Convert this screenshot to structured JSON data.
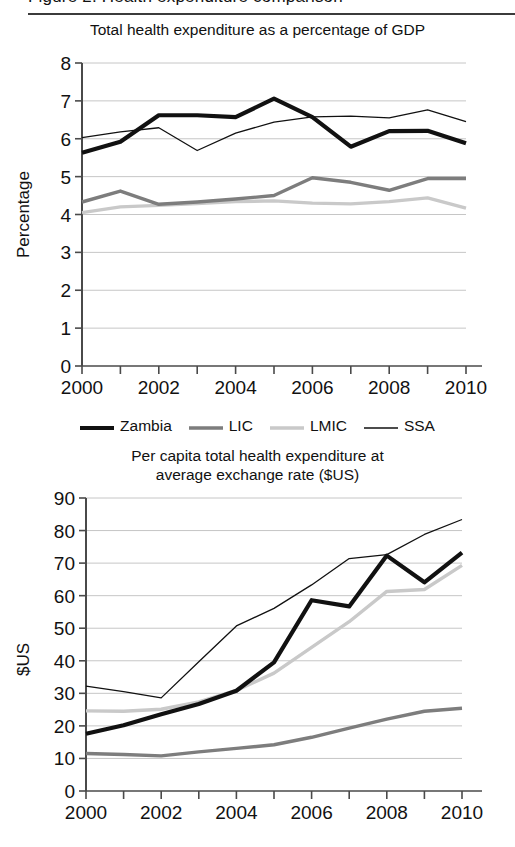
{
  "page": {
    "top_caption": "Figure 2. Health expenditure comparison",
    "background": "#ffffff"
  },
  "legend": {
    "items": [
      {
        "label": "Zambia",
        "color": "#111111",
        "width": 4.2
      },
      {
        "label": "LIC",
        "color": "#7d7d7d",
        "width": 3.4
      },
      {
        "label": "LMIC",
        "color": "#c9c9c9",
        "width": 3.4
      },
      {
        "label": "SSA",
        "color": "#111111",
        "width": 1.3
      }
    ]
  },
  "chart_data": [
    {
      "id": "gdp-share",
      "type": "line",
      "title": "Total health expenditure as a percentage of GDP",
      "xlabel": "",
      "ylabel": "Percentage",
      "x": [
        2000,
        2001,
        2002,
        2003,
        2004,
        2005,
        2006,
        2007,
        2008,
        2009,
        2010
      ],
      "xticklabels": [
        "2000",
        "",
        "2002",
        "",
        "2004",
        "",
        "2006",
        "",
        "2008",
        "",
        "2010"
      ],
      "xlim": [
        2000,
        2010
      ],
      "ylim": [
        0,
        8
      ],
      "yticks": [
        0,
        1,
        2,
        3,
        4,
        5,
        6,
        7,
        8
      ],
      "grid": true,
      "legend_position": "below",
      "series": [
        {
          "name": "Zambia",
          "color": "#111111",
          "width": 4.2,
          "values": [
            5.63,
            5.92,
            6.62,
            6.62,
            6.57,
            7.06,
            6.57,
            5.79,
            6.2,
            6.21,
            5.88
          ]
        },
        {
          "name": "LIC",
          "color": "#7d7d7d",
          "width": 3.4,
          "values": [
            4.33,
            4.62,
            4.27,
            4.33,
            4.41,
            4.5,
            4.97,
            4.85,
            4.64,
            4.95,
            4.95
          ]
        },
        {
          "name": "LMIC",
          "color": "#c9c9c9",
          "width": 3.4,
          "values": [
            4.05,
            4.2,
            4.24,
            4.29,
            4.34,
            4.36,
            4.3,
            4.28,
            4.34,
            4.44,
            4.17
          ]
        },
        {
          "name": "SSA",
          "color": "#111111",
          "width": 1.3,
          "values": [
            6.03,
            6.18,
            6.29,
            5.69,
            6.15,
            6.44,
            6.58,
            6.6,
            6.55,
            6.76,
            6.45
          ]
        }
      ]
    },
    {
      "id": "per-capita",
      "type": "line",
      "title_line1": "Per capita total health expenditure at",
      "title_line2": "average exchange rate ($US)",
      "title": "Per capita total health expenditure at average exchange rate ($US)",
      "xlabel": "",
      "ylabel": "$US",
      "x": [
        2000,
        2001,
        2002,
        2003,
        2004,
        2005,
        2006,
        2007,
        2008,
        2009,
        2010
      ],
      "xticklabels": [
        "2000",
        "",
        "2002",
        "",
        "2004",
        "",
        "2006",
        "",
        "2008",
        "",
        "2010"
      ],
      "xlim": [
        2000,
        2010
      ],
      "ylim": [
        0,
        90
      ],
      "yticks": [
        0,
        10,
        20,
        30,
        40,
        50,
        60,
        70,
        80,
        90
      ],
      "grid": true,
      "legend_position": "shared-above",
      "series": [
        {
          "name": "Zambia",
          "color": "#111111",
          "width": 4.2,
          "values": [
            17.6,
            20.2,
            23.6,
            26.7,
            30.8,
            39.5,
            58.6,
            56.7,
            72.3,
            64.1,
            73.2
          ]
        },
        {
          "name": "LIC",
          "color": "#7d7d7d",
          "width": 3.4,
          "values": [
            11.5,
            11.2,
            10.8,
            12.0,
            13.1,
            14.2,
            16.5,
            19.3,
            22.1,
            24.5,
            25.4
          ]
        },
        {
          "name": "LMIC",
          "color": "#c9c9c9",
          "width": 3.4,
          "values": [
            24.6,
            24.5,
            25.1,
            27.4,
            30.9,
            36.2,
            44.1,
            52.0,
            61.3,
            61.9,
            69.3
          ]
        },
        {
          "name": "SSA",
          "color": "#111111",
          "width": 1.3,
          "values": [
            32.2,
            30.5,
            28.6,
            39.7,
            50.7,
            56.1,
            63.3,
            71.4,
            72.6,
            78.8,
            83.4
          ]
        }
      ]
    }
  ]
}
